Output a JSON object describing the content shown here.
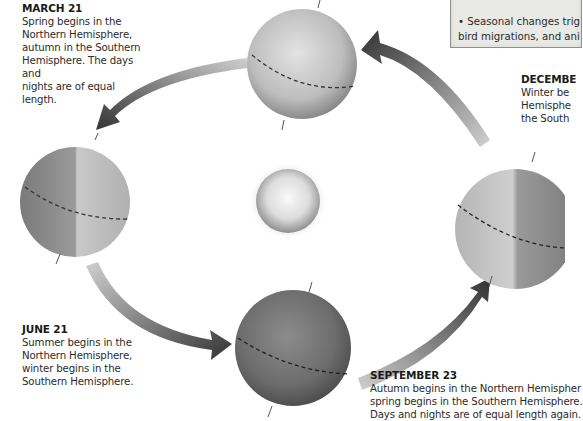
{
  "figure": {
    "topic": "Earth's orbit and the seasons",
    "center_object": "sun-icon",
    "note": {
      "lines": [
        "• Seasonal changes trig",
        "bird migrations, and ani"
      ]
    },
    "positions": [
      {
        "id": "march",
        "date": "MARCH 21",
        "text": "Spring begins in the\nNorthern Hemisphere,\nautumn in the Southern\nHemisphere. The days and\nnights are of equal length."
      },
      {
        "id": "june",
        "date": "JUNE 21",
        "text": "Summer begins in the\nNorthern Hemisphere,\nwinter begins in the\nSouthern Hemisphere."
      },
      {
        "id": "september",
        "date": "SEPTEMBER 23",
        "text": "Autumn begins in the Northern Hemispher\nspring begins in the Southern Hemisphere.\nDays and nights are of equal length again."
      },
      {
        "id": "december",
        "date": "DECEMBE",
        "text": "Winter be\nHemisphe\nthe South"
      }
    ],
    "colors": {
      "arrow_dark": "#3a3a3a",
      "arrow_light": "#c8c8c8",
      "globe_light": "#d6d6d6",
      "globe_dark": "#6b6b6b",
      "sun_core": "#f4f4f4",
      "sun_edge": "#9a9a9a"
    }
  }
}
